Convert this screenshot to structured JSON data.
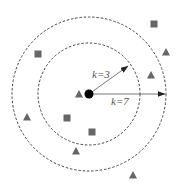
{
  "diagram": {
    "type": "knn-illustration",
    "center": {
      "x": 89,
      "y": 94,
      "shape": "circle",
      "color": "#000000"
    },
    "circles": [
      {
        "name": "inner",
        "r": 51,
        "label": "k=3",
        "style": "dashed"
      },
      {
        "name": "outer",
        "r": 77,
        "label": "k=7",
        "style": "dashed"
      }
    ],
    "arrows": [
      {
        "name": "k3-arrow",
        "from": [
          89,
          94
        ],
        "to": [
          128,
          66
        ],
        "label": "k=3",
        "label_pos": [
          92,
          78
        ]
      },
      {
        "name": "k7-arrow",
        "from": [
          89,
          94
        ],
        "to": [
          165,
          94
        ],
        "label": "k=7",
        "label_pos": [
          111,
          105
        ]
      }
    ],
    "points": [
      {
        "shape": "square",
        "x": 154,
        "y": 24
      },
      {
        "shape": "square",
        "x": 38,
        "y": 54
      },
      {
        "shape": "triangle",
        "x": 166,
        "y": 52
      },
      {
        "shape": "triangle",
        "x": 151,
        "y": 75
      },
      {
        "shape": "triangle",
        "x": 79,
        "y": 94
      },
      {
        "shape": "triangle",
        "x": 27,
        "y": 117
      },
      {
        "shape": "square",
        "x": 67,
        "y": 118
      },
      {
        "shape": "square",
        "x": 92,
        "y": 132
      },
      {
        "shape": "triangle",
        "x": 76,
        "y": 151
      },
      {
        "shape": "triangle",
        "x": 133,
        "y": 175
      }
    ],
    "colors": {
      "marker": "#666666",
      "line": "#555555",
      "center": "#000000"
    }
  },
  "labels": {
    "k3": "k=3",
    "k7": "k=7"
  }
}
